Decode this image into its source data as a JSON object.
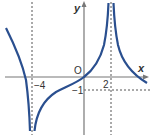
{
  "figure": {
    "type": "function-graph",
    "axes": {
      "x_label": "x",
      "y_label": "y",
      "origin_label": "O"
    },
    "tick_labels": {
      "x_neg4": "−4",
      "x_2": "2",
      "y_neg1": "−1"
    },
    "asymptotes": {
      "vertical": [
        -4,
        2
      ],
      "horizontal_guide": -1
    },
    "colors": {
      "curve": "#2a4f8f",
      "axes": "#777777",
      "dashed": "#555555",
      "text": "#333333"
    }
  }
}
